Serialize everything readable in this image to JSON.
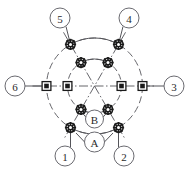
{
  "diagram": {
    "type": "technical-schematic",
    "geometry": {
      "center_x": 94.5,
      "center_y": 86.0,
      "outer_radius": 48.0,
      "inner_radius": 27.0,
      "node_angles_deg": [
        0,
        60,
        120,
        180,
        240,
        300
      ],
      "axis_line_half_length": 62.0
    },
    "colors": {
      "line": "#55555a",
      "node_fill": "#1a1a1a",
      "node_stroke": "#1a1a1a",
      "callout_stroke": "#6a6a70",
      "text": "#2b2b2b",
      "background": "#ffffff"
    },
    "outer_nodes": [
      {
        "id": "outer-0",
        "angle": 0,
        "marker": "square-node"
      },
      {
        "id": "outer-60",
        "angle": 60,
        "marker": "gear-node"
      },
      {
        "id": "outer-120",
        "angle": 120,
        "marker": "gear-node"
      },
      {
        "id": "outer-180",
        "angle": 180,
        "marker": "square-node"
      },
      {
        "id": "outer-240",
        "angle": 240,
        "marker": "gear-node"
      },
      {
        "id": "outer-300",
        "angle": 300,
        "marker": "gear-node"
      }
    ],
    "inner_nodes": [
      {
        "id": "inner-0",
        "angle": 0,
        "marker": "square-node"
      },
      {
        "id": "inner-60",
        "angle": 60,
        "marker": "gear-node"
      },
      {
        "id": "inner-120",
        "angle": 120,
        "marker": "gear-node"
      },
      {
        "id": "inner-180",
        "angle": 180,
        "marker": "square-node"
      },
      {
        "id": "inner-240",
        "angle": 240,
        "marker": "gear-node"
      },
      {
        "id": "inner-300",
        "angle": 300,
        "marker": "gear-node"
      }
    ],
    "callouts": [
      {
        "key": "c1",
        "label": "1",
        "cx": 65,
        "cy": 156,
        "r": 10,
        "leader_to_angle": 240,
        "leader_ring": "outer"
      },
      {
        "key": "c2",
        "label": "2",
        "cx": 124,
        "cy": 156,
        "r": 10,
        "leader_to_angle": 300,
        "leader_ring": "outer"
      },
      {
        "key": "c3",
        "label": "3",
        "cx": 174,
        "cy": 86,
        "r": 10,
        "leader_to_angle": 0,
        "leader_ring": "outer"
      },
      {
        "key": "c4",
        "label": "4",
        "cx": 129,
        "cy": 18,
        "r": 10,
        "leader_to_angle": 60,
        "leader_ring": "outer"
      },
      {
        "key": "c5",
        "label": "5",
        "cx": 60,
        "cy": 18,
        "r": 10,
        "leader_to_angle": 120,
        "leader_ring": "outer"
      },
      {
        "key": "c6",
        "label": "6",
        "cx": 15,
        "cy": 86,
        "r": 10,
        "leader_to_angle": 180,
        "leader_ring": "outer"
      },
      {
        "key": "cA",
        "label": "A",
        "cx": 94.5,
        "cy": 142,
        "r": 10,
        "leader_to_angle": null,
        "leader_ring": "none"
      },
      {
        "key": "cB",
        "label": "B",
        "cx": 94.5,
        "cy": 119,
        "r": 9,
        "leader_to_angle": null,
        "leader_ring": "none"
      }
    ],
    "arcs": {
      "outer_arc_pairs": [
        [
          120,
          60
        ],
        [
          240,
          300
        ]
      ],
      "inner_arc_pairs": [
        [
          120,
          60
        ],
        [
          240,
          300
        ]
      ]
    }
  }
}
